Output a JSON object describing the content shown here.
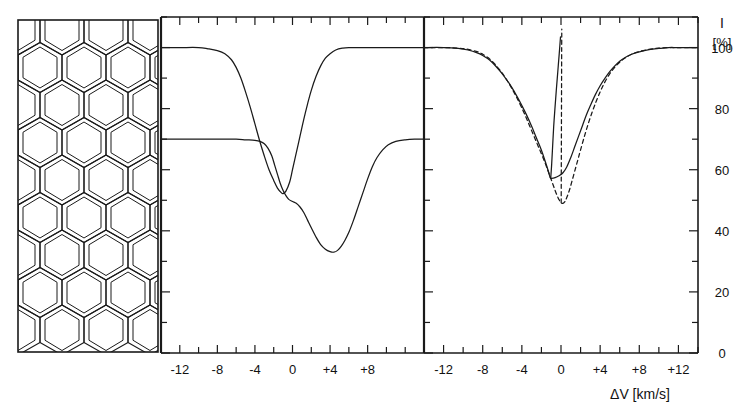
{
  "figure": {
    "width": 755,
    "height": 408,
    "background": "#ffffff",
    "ink_color": "#1a1a1a"
  },
  "panels": {
    "left": {
      "name": "honeycomb-lattice-panel",
      "description": "hexagonal honeycomb lattice pattern",
      "box": {
        "x": 18,
        "y": 20,
        "width": 140,
        "height": 332
      },
      "hex": {
        "pitch_x": 44,
        "pitch_y": 50,
        "wall_gap": 5
      }
    },
    "middle": {
      "name": "middle-profile-panel",
      "box": {
        "x": 161,
        "y": 17,
        "width": 263,
        "height": 336
      }
    },
    "right": {
      "name": "right-profile-panel",
      "box": {
        "x": 424,
        "y": 17,
        "width": 274,
        "height": 336
      }
    }
  },
  "axes": {
    "x": {
      "label": "ΔV",
      "unit": "[km/s]",
      "unit_open": "[",
      "unit_close": "]",
      "unit_text": "km/s",
      "min": -14,
      "max": 14,
      "minor_tick_step": 2,
      "labeled_ticks_middle": [
        "-12",
        "-8",
        "-4",
        "0",
        "+4",
        "+8"
      ],
      "labeled_ticks_right": [
        "-12",
        "-8",
        "-4",
        "0",
        "+4",
        "+8",
        "+12"
      ],
      "labeled_tick_values_middle": [
        -12,
        -8,
        -4,
        0,
        4,
        8
      ],
      "labeled_tick_values_right": [
        -12,
        -8,
        -4,
        0,
        4,
        8,
        12
      ]
    },
    "y": {
      "label": "I",
      "unit": "[%]",
      "min": 0,
      "max": 110,
      "minor_tick_step": 10,
      "labeled_ticks": [
        "100",
        "80",
        "60",
        "40",
        "20",
        "0"
      ],
      "labeled_tick_values": [
        100,
        80,
        60,
        40,
        20,
        0
      ]
    }
  },
  "chart_data": {
    "type": "line",
    "title": "",
    "xlabel": "ΔV [km/s]",
    "ylabel": "I [%]",
    "xlim": [
      -14,
      14
    ],
    "ylim": [
      0,
      110
    ],
    "grid": false,
    "legend": "none",
    "panels": [
      {
        "panel": "middle",
        "series": [
          {
            "name": "broad-blueshifted-profile",
            "style": "solid",
            "continuum": 100,
            "minimum_depth": 52,
            "minimum_velocity": -1.0,
            "points": [
              [
                -14,
                100
              ],
              [
                -12,
                100
              ],
              [
                -10,
                100
              ],
              [
                -9,
                99.6
              ],
              [
                -8,
                99.0
              ],
              [
                -7.2,
                98.0
              ],
              [
                -6.5,
                96.0
              ],
              [
                -6,
                93.5
              ],
              [
                -5.5,
                90.0
              ],
              [
                -5,
                85.5
              ],
              [
                -4.5,
                80.5
              ],
              [
                -4,
                75.0
              ],
              [
                -3.5,
                69.5
              ],
              [
                -3,
                64.5
              ],
              [
                -2.5,
                60.0
              ],
              [
                -2,
                56.5
              ],
              [
                -1.6,
                54.0
              ],
              [
                -1.2,
                52.5
              ],
              [
                -1.0,
                52.2
              ],
              [
                -0.7,
                53.0
              ],
              [
                -0.3,
                56.0
              ],
              [
                0,
                60.0
              ],
              [
                0.4,
                65.5
              ],
              [
                0.8,
                71.0
              ],
              [
                1.2,
                76.5
              ],
              [
                1.6,
                81.5
              ],
              [
                2,
                86.0
              ],
              [
                2.5,
                90.5
              ],
              [
                3,
                94.0
              ],
              [
                3.5,
                96.5
              ],
              [
                4,
                98.0
              ],
              [
                4.6,
                99.2
              ],
              [
                5.3,
                99.8
              ],
              [
                6,
                100
              ],
              [
                8,
                100
              ],
              [
                10,
                100
              ],
              [
                12,
                100
              ],
              [
                14,
                100
              ]
            ]
          },
          {
            "name": "shallow-redshifted-profile",
            "style": "solid",
            "continuum": 70,
            "minimum_depth": 33,
            "minimum_velocity": 4.2,
            "points": [
              [
                -14,
                70
              ],
              [
                -12,
                70
              ],
              [
                -10,
                70
              ],
              [
                -8,
                70
              ],
              [
                -6,
                70
              ],
              [
                -5,
                69.8
              ],
              [
                -4,
                69.6
              ],
              [
                -3.4,
                69.2
              ],
              [
                -3,
                68.5
              ],
              [
                -2.6,
                67.0
              ],
              [
                -2.2,
                64.5
              ],
              [
                -1.9,
                61.5
              ],
              [
                -1.6,
                58.5
              ],
              [
                -1.3,
                55.5
              ],
              [
                -1.0,
                53.2
              ],
              [
                -0.7,
                51.5
              ],
              [
                -0.4,
                50.3
              ],
              [
                0,
                49.6
              ],
              [
                0.4,
                49.0
              ],
              [
                0.8,
                47.8
              ],
              [
                1.2,
                46.0
              ],
              [
                1.6,
                43.5
              ],
              [
                2,
                41.0
              ],
              [
                2.5,
                38.0
              ],
              [
                3,
                35.5
              ],
              [
                3.5,
                34.0
              ],
              [
                4,
                33.2
              ],
              [
                4.4,
                33.0
              ],
              [
                4.8,
                33.6
              ],
              [
                5.2,
                35.0
              ],
              [
                5.6,
                37.0
              ],
              [
                6,
                39.5
              ],
              [
                6.5,
                43.5
              ],
              [
                7,
                48.0
              ],
              [
                7.5,
                52.5
              ],
              [
                8,
                57.0
              ],
              [
                8.5,
                61.0
              ],
              [
                9,
                64.0
              ],
              [
                9.6,
                66.5
              ],
              [
                10.2,
                68.2
              ],
              [
                11,
                69.3
              ],
              [
                12,
                69.8
              ],
              [
                13,
                70
              ],
              [
                14,
                70
              ]
            ]
          }
        ]
      },
      {
        "panel": "right",
        "series": [
          {
            "name": "broad-solid-profile",
            "style": "solid",
            "continuum": 100,
            "minimum_depth": 57,
            "minimum_velocity": -1.1,
            "points": [
              [
                -14,
                100
              ],
              [
                -12,
                100
              ],
              [
                -10.5,
                99.7
              ],
              [
                -9.5,
                99.2
              ],
              [
                -8.5,
                98.2
              ],
              [
                -8,
                97.4
              ],
              [
                -7.5,
                96.4
              ],
              [
                -7,
                95.0
              ],
              [
                -6.5,
                93.3
              ],
              [
                -6,
                91.4
              ],
              [
                -5.5,
                89.2
              ],
              [
                -5,
                86.8
              ],
              [
                -4.5,
                84.0
              ],
              [
                -4,
                81.0
              ],
              [
                -3.5,
                77.8
              ],
              [
                -3,
                74.2
              ],
              [
                -2.5,
                70.3
              ],
              [
                -2,
                66.4
              ],
              [
                -1.6,
                62.6
              ],
              [
                -1.3,
                59.6
              ],
              [
                -1.1,
                57.4
              ],
              [
                -0.95,
                57.2
              ],
              [
                -0.6,
                57.4
              ],
              [
                -0.2,
                58.0
              ],
              [
                0.2,
                59.0
              ],
              [
                0.6,
                61.0
              ],
              [
                1,
                64.0
              ],
              [
                1.4,
                67.5
              ],
              [
                1.8,
                71.0
              ],
              [
                2.2,
                74.5
              ],
              [
                2.6,
                78.0
              ],
              [
                3,
                81.0
              ],
              [
                3.5,
                84.5
              ],
              [
                4,
                87.5
              ],
              [
                4.5,
                90.0
              ],
              [
                5,
                92.2
              ],
              [
                5.5,
                94.0
              ],
              [
                6,
                95.5
              ],
              [
                6.6,
                96.8
              ],
              [
                7.2,
                97.8
              ],
              [
                8,
                98.6
              ],
              [
                9,
                99.3
              ],
              [
                10,
                99.7
              ],
              [
                11,
                100
              ],
              [
                12,
                100
              ],
              [
                14,
                100
              ]
            ]
          },
          {
            "name": "narrow-solid-core",
            "style": "solid",
            "continuum": 100,
            "minimum_depth": 57,
            "minimum_velocity": -1.0,
            "points": [
              [
                -1.05,
                57.2
              ],
              [
                -0.95,
                62
              ],
              [
                -0.85,
                68
              ],
              [
                -0.75,
                74
              ],
              [
                -0.62,
                80
              ],
              [
                -0.48,
                86
              ],
              [
                -0.33,
                92
              ],
              [
                -0.18,
                98
              ],
              [
                -0.05,
                103.5
              ]
            ]
          },
          {
            "name": "broad-dashed-profile",
            "style": "dashed",
            "continuum": 100,
            "minimum_depth": 49,
            "minimum_velocity": 0.0,
            "points": [
              [
                -14,
                100
              ],
              [
                -12,
                100
              ],
              [
                -10.5,
                99.8
              ],
              [
                -9.5,
                99.4
              ],
              [
                -8.5,
                98.6
              ],
              [
                -8,
                97.8
              ],
              [
                -7.5,
                96.8
              ],
              [
                -7,
                95.4
              ],
              [
                -6.5,
                93.6
              ],
              [
                -6,
                91.6
              ],
              [
                -5.5,
                89.2
              ],
              [
                -5,
                86.5
              ],
              [
                -4.5,
                83.5
              ],
              [
                -4,
                80.2
              ],
              [
                -3.5,
                76.6
              ],
              [
                -3,
                72.8
              ],
              [
                -2.5,
                69.0
              ],
              [
                -2,
                65.2
              ],
              [
                -1.6,
                62.0
              ],
              [
                -1.3,
                59.4
              ],
              [
                -1.05,
                57.2
              ],
              [
                -0.8,
                55.0
              ],
              [
                -0.6,
                53.2
              ],
              [
                -0.4,
                51.6
              ],
              [
                -0.2,
                50.2
              ],
              [
                0,
                49.2
              ],
              [
                0.2,
                49.0
              ],
              [
                0.4,
                49.6
              ],
              [
                0.6,
                51.0
              ],
              [
                0.85,
                53.2
              ],
              [
                1.1,
                56.0
              ],
              [
                1.4,
                59.5
              ],
              [
                1.7,
                63.0
              ],
              [
                2,
                66.5
              ],
              [
                2.4,
                71.0
              ],
              [
                2.8,
                75.2
              ],
              [
                3.2,
                79.0
              ],
              [
                3.6,
                82.4
              ],
              [
                4,
                85.5
              ],
              [
                4.4,
                88.2
              ],
              [
                4.9,
                91.0
              ],
              [
                5.4,
                93.2
              ],
              [
                6,
                95.2
              ],
              [
                6.6,
                96.7
              ],
              [
                7.3,
                97.9
              ],
              [
                8,
                98.7
              ],
              [
                9,
                99.4
              ],
              [
                10,
                99.8
              ],
              [
                11,
                100
              ],
              [
                12,
                100
              ],
              [
                14,
                100
              ]
            ]
          },
          {
            "name": "narrow-dashed-core",
            "style": "dashed",
            "continuum": 100,
            "minimum_depth": 49,
            "minimum_velocity": 0.0,
            "points": [
              [
                0.02,
                49.2
              ],
              [
                0.03,
                60
              ],
              [
                0.04,
                70
              ],
              [
                0.05,
                80
              ],
              [
                0.06,
                90
              ],
              [
                0.07,
                100
              ],
              [
                0.08,
                106
              ]
            ]
          }
        ]
      }
    ]
  }
}
